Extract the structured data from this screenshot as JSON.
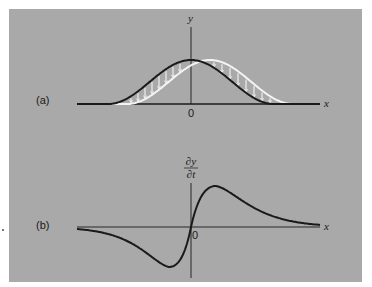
{
  "figure": {
    "background_color": "#a9a9a9",
    "panel_a": {
      "label": "(a)",
      "y_axis_label": "y",
      "x_axis_label": "x",
      "origin_label": "0",
      "curves": [
        {
          "name": "pulse-initial",
          "color": "#1a1a1a",
          "description": "Gaussian pulse centered at x=0"
        },
        {
          "name": "pulse-shifted",
          "color": "#f4f4f4",
          "description": "Same pulse shifted right (later time)"
        }
      ],
      "arrows": {
        "color": "#f4f4f4",
        "direction": "down",
        "count": 13
      }
    },
    "panel_b": {
      "label": "(b)",
      "y_axis_label_numerator": "∂y",
      "y_axis_label_denominator": "∂t",
      "x_axis_label": "x",
      "origin_label": "0",
      "curves": [
        {
          "name": "time-derivative",
          "color": "#1a1a1a",
          "description": "∂y/∂t: negative lobe left of origin, positive lobe right"
        }
      ]
    }
  },
  "geometry": {
    "a": {
      "x0": 191,
      "baseline": 104,
      "left": 77,
      "right": 320,
      "axisTop": 27,
      "amp": 44,
      "sigma": 30,
      "shift": 19,
      "halfWidth": 83
    },
    "b": {
      "x0": 191,
      "baseline": 227,
      "left": 77,
      "right": 320,
      "axisTop": 183,
      "axisBottom": 278,
      "posPeakX": 216,
      "posPeakY": 186,
      "negPeakX": 169,
      "negPeakY": 267
    }
  }
}
